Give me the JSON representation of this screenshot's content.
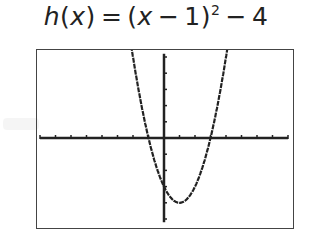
{
  "title": {
    "fn": "h",
    "var": "x",
    "eq": "=",
    "lparen_expr": "(",
    "inner_var": "x",
    "minus1": "−",
    "one": "1)",
    "exp": "2",
    "minus2": "−",
    "const": "4",
    "full": "h(x) = (x − 1)² − 4"
  },
  "chart_data": {
    "type": "line",
    "xlabel": "",
    "ylabel": "",
    "xlim": [
      -8,
      8
    ],
    "ylim": [
      -5.2,
      5.2
    ],
    "grid": false,
    "axes": true,
    "x_tick_step": 1,
    "y_tick_step": 1,
    "style": "graphing-calculator-screen",
    "series": [
      {
        "name": "h(x)",
        "function": "(x-1)^2-4",
        "vertex": [
          1,
          -4
        ],
        "roots": [
          -1,
          3
        ],
        "y_intercept": -3,
        "x": [
          -2.2,
          -2,
          -1.5,
          -1,
          -0.5,
          0,
          0.5,
          1,
          1.5,
          2,
          2.5,
          3,
          3.5,
          4,
          4.2
        ],
        "values": [
          6.24,
          5,
          2.25,
          0,
          -1.75,
          -3,
          -3.75,
          -4,
          -3.75,
          -3,
          -1.75,
          0,
          2.25,
          5,
          6.24
        ]
      }
    ]
  },
  "colors": {
    "axis": "#222222",
    "curve": "#222222",
    "frame": "#444444",
    "background": "#ffffff"
  }
}
